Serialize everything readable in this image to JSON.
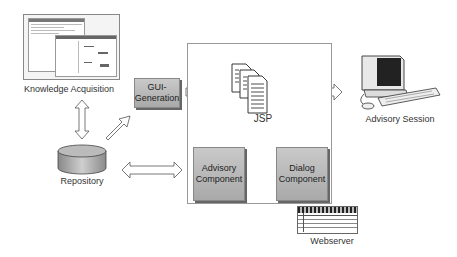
{
  "nodes": {
    "knowledge_acquisition": {
      "label": "Knowledge Acquisition"
    },
    "gui_generation": {
      "label_line1": "GUI-",
      "label_line2": "Generation"
    },
    "repository": {
      "label": "Repository"
    },
    "jsp": {
      "label": "JSP"
    },
    "advisory_component": {
      "label_line1": "Advisory",
      "label_line2": "Component"
    },
    "dialog_component": {
      "label_line1": "Dialog",
      "label_line2": "Component"
    },
    "advisory_session": {
      "label": "Advisory Session"
    },
    "webserver": {
      "label": "Webserver"
    }
  },
  "edges": [
    {
      "from": "knowledge_acquisition",
      "to": "repository",
      "type": "bidirectional"
    },
    {
      "from": "repository",
      "to": "gui_generation",
      "type": "directed"
    },
    {
      "from": "gui_generation",
      "to": "jsp",
      "type": "directed"
    },
    {
      "from": "jsp",
      "to": "advisory_session",
      "type": "bidirectional"
    },
    {
      "from": "repository",
      "to": "advisory_component",
      "type": "bidirectional"
    },
    {
      "from": "jsp",
      "to": "advisory_component",
      "type": "bidirectional"
    },
    {
      "from": "jsp",
      "to": "dialog_component",
      "type": "bidirectional"
    },
    {
      "from": "advisory_component",
      "to": "dialog_component",
      "type": "bidirectional"
    }
  ],
  "colors": {
    "component_fill": "#b8b8b8",
    "arrow_stroke": "#555555",
    "box_border": "#999999"
  }
}
